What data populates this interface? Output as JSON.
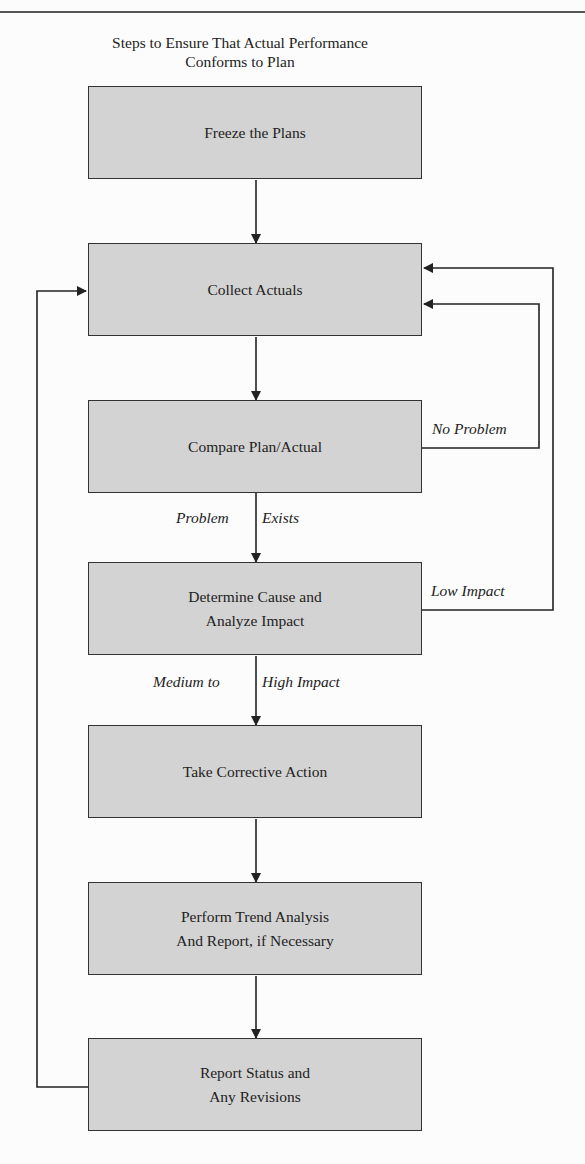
{
  "title": {
    "line1": "Steps to Ensure That Actual Performance",
    "line2": "Conforms to Plan"
  },
  "steps": [
    {
      "label": "Freeze the Plans"
    },
    {
      "label": "Collect Actuals"
    },
    {
      "label": "Compare Plan/Actual"
    },
    {
      "label_line1": "Determine Cause and",
      "label_line2": "Analyze Impact"
    },
    {
      "label": "Take Corrective Action"
    },
    {
      "label_line1": "Perform Trend Analysis",
      "label_line2": "And Report, if Necessary"
    },
    {
      "label_line1": "Report Status and",
      "label_line2": "Any Revisions"
    }
  ],
  "edge_labels": {
    "no_problem": "No Problem",
    "problem": "Problem",
    "exists": "Exists",
    "low_impact": "Low Impact",
    "medium_to": "Medium to",
    "high_impact": "High Impact"
  },
  "colors": {
    "box_fill": "#d3d3d3",
    "line": "#222222"
  }
}
